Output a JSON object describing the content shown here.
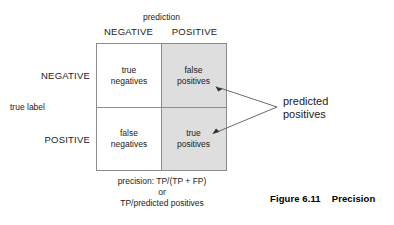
{
  "figure": {
    "caption_number": "Figure 6.11",
    "caption_title": "Precision",
    "caption_full": "Figure 6.11    Precision"
  },
  "matrix": {
    "column_axis_label": "prediction",
    "row_axis_label": "true label",
    "column_headers": [
      "NEGATIVE",
      "POSITIVE"
    ],
    "row_headers": [
      "NEGATIVE",
      "POSITIVE"
    ],
    "cells": [
      {
        "id": "tl",
        "line1": "true",
        "line2": "negatives",
        "shaded": false
      },
      {
        "id": "tr",
        "line1": "false",
        "line2": "positives",
        "shaded": true
      },
      {
        "id": "bl",
        "line1": "false",
        "line2": "negatives",
        "shaded": false
      },
      {
        "id": "br",
        "line1": "true",
        "line2": "positives",
        "shaded": true
      }
    ],
    "shade_color": "#dedede",
    "border_color": "#8c8c8c"
  },
  "formula": {
    "line1": "precision: TP/(TP + FP)",
    "line2": "or",
    "line3": "TP/predicted positives"
  },
  "callout": {
    "line1": "predicted",
    "line2": "positives"
  }
}
